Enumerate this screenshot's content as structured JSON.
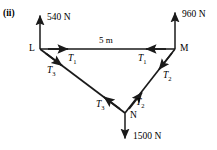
{
  "figure": {
    "part_label": "(ii)",
    "top_cut_text": "",
    "stroke_color": "#1a1a1a",
    "background_color": "#ffffff"
  },
  "vertices": [
    {
      "name": "L",
      "label": "L",
      "x": 40,
      "y": 49
    },
    {
      "name": "M",
      "label": "M",
      "x": 175,
      "y": 49
    },
    {
      "name": "N",
      "label": "N",
      "x": 125,
      "y": 113
    }
  ],
  "external_forces": [
    {
      "name": "force-at-L",
      "label": "540 N",
      "at": "L",
      "direction": "up",
      "x": 40,
      "y1": 49,
      "y2": 13
    },
    {
      "name": "force-at-M",
      "label": "960 N",
      "at": "M",
      "direction": "up",
      "x": 175,
      "y1": 49,
      "y2": 10
    },
    {
      "name": "force-at-N",
      "label": "1500 N",
      "at": "N",
      "direction": "down",
      "x": 125,
      "y1": 113,
      "y2": 141
    }
  ],
  "members": [
    {
      "name": "member-LM",
      "from": "L",
      "to": "M",
      "tension": "T1",
      "dimension": "5 m"
    },
    {
      "name": "member-MN",
      "from": "M",
      "to": "N",
      "tension": "T2",
      "dimension": ""
    },
    {
      "name": "member-LN",
      "from": "L",
      "to": "N",
      "tension": "T3",
      "dimension": ""
    }
  ],
  "tension_labels": [
    {
      "name": "tension-T1-at-L",
      "base": "T",
      "sub": "1"
    },
    {
      "name": "tension-T1-at-M",
      "base": "T",
      "sub": "1"
    },
    {
      "name": "tension-T2-at-M",
      "base": "T",
      "sub": "2"
    },
    {
      "name": "tension-T2-at-N",
      "base": "T",
      "sub": "2"
    },
    {
      "name": "tension-T3-at-L",
      "base": "T",
      "sub": "3"
    },
    {
      "name": "tension-T3-at-N",
      "base": "T",
      "sub": "3"
    }
  ],
  "dimension": {
    "name": "span-LM",
    "label": "5 m"
  }
}
